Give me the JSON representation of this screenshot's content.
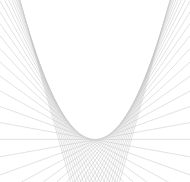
{
  "figure": {
    "width": 190,
    "height": 182,
    "background_color": "#ffffff",
    "line_color": "#c6c6c6",
    "line_width": 0.6,
    "line_opacity": 0.85
  },
  "chart_data": {
    "type": "line",
    "subtitle": "Family of tangent lines to a parabola (string-art envelope)",
    "xlabel": "",
    "ylabel": "",
    "grid": false,
    "legend": false,
    "axes_visible": false,
    "ticks_visible": false,
    "xlim": [
      -3.4,
      3.4
    ],
    "ylim": [
      -2.2,
      7.2
    ],
    "envelope_curve": {
      "name": "parabola",
      "equation": "y = x^2",
      "vertex_px": [
        96,
        146
      ],
      "vertex_data": [
        0,
        0
      ],
      "opens": "up"
    },
    "tangent_family": {
      "description": "Line tangent to y = x^2 at x = t has equation y = 2*t*x - t^2",
      "equation": "y = 2*t*x - t^2",
      "parameter_name": "t",
      "parameter_count": 41,
      "parameter_min": -2.6,
      "parameter_max": 2.6,
      "parameter_step": 0.13,
      "parameter_values": [
        -2.6,
        -2.47,
        -2.34,
        -2.21,
        -2.08,
        -1.95,
        -1.82,
        -1.69,
        -1.56,
        -1.43,
        -1.3,
        -1.17,
        -1.04,
        -0.91,
        -0.78,
        -0.65,
        -0.52,
        -0.39,
        -0.26,
        -0.13,
        0.0,
        0.13,
        0.26,
        0.39,
        0.52,
        0.65,
        0.78,
        0.91,
        1.04,
        1.17,
        1.3,
        1.43,
        1.56,
        1.69,
        1.82,
        1.95,
        2.08,
        2.21,
        2.34,
        2.47,
        2.6
      ]
    },
    "series": [
      {
        "name": "tangent lines",
        "stroke": "#c6c6c6",
        "count": 41
      }
    ]
  }
}
